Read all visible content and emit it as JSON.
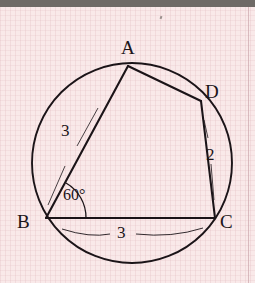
{
  "figure": {
    "type": "cyclic-quadrilateral-in-circle",
    "stroke_color": "#1b1418",
    "background_color": "#f9e9e9",
    "top_bar_color": "#6e6a66",
    "circle": {
      "cx": 132,
      "cy": 163,
      "r": 100
    },
    "vertices": [
      {
        "id": "A",
        "label": "A",
        "x": 128,
        "y": 66,
        "label_x": 121,
        "label_y": 38
      },
      {
        "id": "B",
        "label": "B",
        "x": 46,
        "y": 218,
        "label_x": 17,
        "label_y": 212
      },
      {
        "id": "C",
        "label": "C",
        "x": 215,
        "y": 218,
        "label_x": 220,
        "label_y": 212
      },
      {
        "id": "D",
        "label": "D",
        "x": 201,
        "y": 101,
        "label_x": 205,
        "label_y": 82
      }
    ],
    "segments": [
      {
        "from": "A",
        "to": "B"
      },
      {
        "from": "A",
        "to": "D"
      },
      {
        "from": "D",
        "to": "C"
      },
      {
        "from": "B",
        "to": "C"
      }
    ],
    "measurements": [
      {
        "id": "ab-length",
        "value": "3",
        "for_segment": "A-B",
        "x": 61,
        "y": 122
      },
      {
        "id": "dc-length",
        "value": "2",
        "for_segment": "D-C",
        "x": 206,
        "y": 146
      },
      {
        "id": "bc-length",
        "value": "3",
        "for_segment": "B-C",
        "x": 117,
        "y": 224
      },
      {
        "id": "angle-b",
        "value": "60°",
        "at_vertex": "B",
        "x": 63,
        "y": 187
      }
    ]
  }
}
